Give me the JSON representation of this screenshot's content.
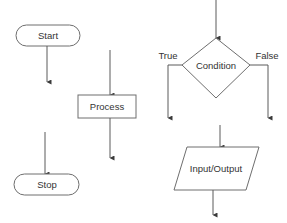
{
  "diagram": {
    "type": "flowchart-symbols",
    "colors": {
      "stroke": "#6e6e6e",
      "arrow": "#5a5a5a",
      "text": "#333333",
      "background": "#ffffff"
    },
    "nodes": [
      {
        "id": "start",
        "shape": "terminator",
        "label": "Start"
      },
      {
        "id": "process",
        "shape": "rectangle",
        "label": "Process"
      },
      {
        "id": "stop",
        "shape": "terminator",
        "label": "Stop"
      },
      {
        "id": "condition",
        "shape": "diamond",
        "label": "Condition"
      },
      {
        "id": "io",
        "shape": "parallelogram",
        "label": "Input/Output"
      }
    ],
    "branch_labels": {
      "true": "True",
      "false": "False"
    }
  }
}
